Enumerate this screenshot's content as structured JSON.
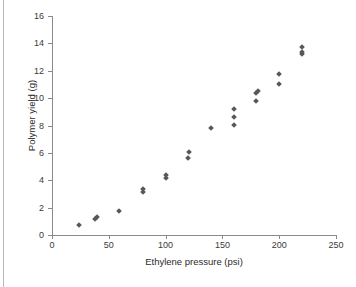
{
  "figure": {
    "background_color": "#ffffff",
    "marker_color": "#585858",
    "axis_color": "#8a8a8a",
    "caption_partial": ""
  },
  "chart_data": {
    "type": "scatter",
    "title": "",
    "xlabel": "Ethylene pressure (psi)",
    "ylabel": "Polymer yield (g)",
    "xlim": [
      0,
      250
    ],
    "ylim": [
      0,
      16
    ],
    "xticks": [
      0,
      50,
      100,
      150,
      200,
      250
    ],
    "yticks": [
      0,
      2,
      4,
      6,
      8,
      10,
      12,
      14,
      16
    ],
    "grid": false,
    "legend": "none",
    "marker": "diamond",
    "points": [
      {
        "x": 24,
        "y": 0.7
      },
      {
        "x": 38,
        "y": 1.15
      },
      {
        "x": 40,
        "y": 1.3
      },
      {
        "x": 59,
        "y": 1.75
      },
      {
        "x": 80,
        "y": 3.15
      },
      {
        "x": 80,
        "y": 3.35
      },
      {
        "x": 100,
        "y": 4.15
      },
      {
        "x": 100,
        "y": 4.4
      },
      {
        "x": 120,
        "y": 5.65
      },
      {
        "x": 121,
        "y": 6.05
      },
      {
        "x": 140,
        "y": 7.85
      },
      {
        "x": 160,
        "y": 8.05
      },
      {
        "x": 160,
        "y": 8.65
      },
      {
        "x": 160,
        "y": 9.2
      },
      {
        "x": 180,
        "y": 9.8
      },
      {
        "x": 180,
        "y": 10.4
      },
      {
        "x": 181,
        "y": 10.5
      },
      {
        "x": 200,
        "y": 11.05
      },
      {
        "x": 200,
        "y": 11.75
      },
      {
        "x": 220,
        "y": 13.25
      },
      {
        "x": 220,
        "y": 13.4
      },
      {
        "x": 220,
        "y": 13.7
      }
    ]
  }
}
